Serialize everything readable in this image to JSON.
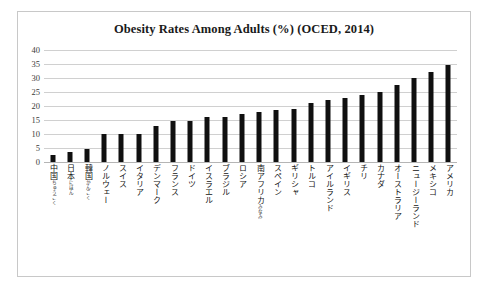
{
  "chart_data": {
    "type": "bar",
    "title": "Obesity Rates Among Adults (%) (OCED, 2014)",
    "xlabel": "",
    "ylabel": "",
    "ylim": [
      0,
      40
    ],
    "ytick_step": 5,
    "yticks": [
      "0",
      "5",
      "10",
      "15",
      "20",
      "25",
      "30",
      "35",
      "40"
    ],
    "grid": true,
    "legend": "none",
    "orientation": "vertical",
    "bar_color": "#101010",
    "categories": [
      "中国",
      "日本",
      "韓国",
      "ノルウェー",
      "スイス",
      "イタリア",
      "デンマーク",
      "フランス",
      "ドイツ",
      "イスラエル",
      "ブラジル",
      "ロシア",
      "南アフリカ",
      "スペイン",
      "ギリシャ",
      "トルコ",
      "アイルランド",
      "イギリス",
      "チリ",
      "カナダ",
      "オーストラリア",
      "ニュージーランド",
      "メキシコ",
      "アメリカ"
    ],
    "category_ruby": [
      "ちゅうごく",
      "にほん",
      "かんこく",
      "",
      "",
      "",
      "",
      "",
      "",
      "",
      "",
      "",
      "みなみ",
      "",
      "",
      "",
      "",
      "",
      "",
      "",
      "",
      "",
      "",
      ""
    ],
    "values": [
      2.5,
      3.5,
      4.5,
      10,
      10,
      10,
      13,
      14.5,
      14.5,
      16,
      16,
      17,
      18,
      18.5,
      19,
      21,
      22,
      23,
      24,
      25,
      27.5,
      30,
      32,
      34.5
    ]
  },
  "frame": {
    "border_color": "#c8c8c8"
  }
}
